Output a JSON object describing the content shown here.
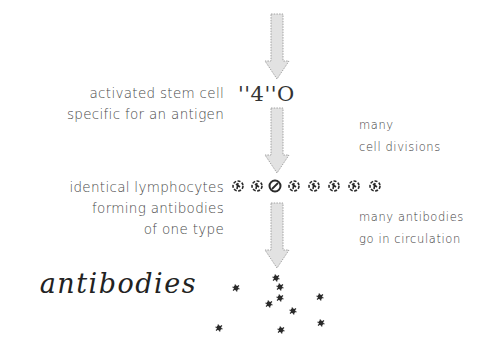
{
  "diagram": {
    "stages": [
      {
        "id": "stem-cell",
        "label_lines": [
          "activated stem cell",
          "specific for an antigen"
        ],
        "glyph": "''4''O"
      },
      {
        "id": "lymphocytes",
        "label_lines": [
          "identical lymphocytes",
          "forming antibodies",
          "of one type"
        ],
        "count": 8
      },
      {
        "id": "antibodies",
        "label": "antibodies",
        "count": 10
      }
    ],
    "transitions": [
      {
        "label_lines": [
          "many",
          "cell divisions"
        ]
      },
      {
        "label_lines": [
          "many antibodies",
          "go in circulation"
        ]
      }
    ],
    "colors": {
      "arrow_fill": "#e2e2e2",
      "arrow_stroke": "#9a9a9a",
      "cell": "#2a2a2a",
      "text": "#4a4a4a"
    }
  }
}
